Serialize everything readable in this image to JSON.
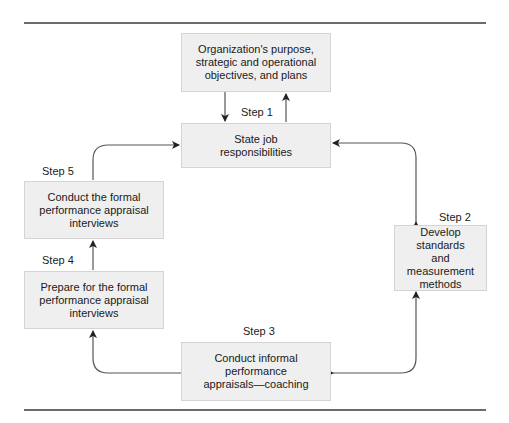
{
  "diagram": {
    "boxes": {
      "purpose": {
        "text": "Organization's purpose,\nstrategic and operational\nobjectives, and plans"
      },
      "step1": {
        "text": "State job\nresponsibilities"
      },
      "step2": {
        "text": "Develop standards\nand measurement\nmethods"
      },
      "step3": {
        "text": "Conduct informal performance\nappraisals—coaching"
      },
      "step4": {
        "text": "Prepare for the formal\nperformance appraisal\ninterviews"
      },
      "step5": {
        "text": "Conduct the formal\nperformance appraisal\ninterviews"
      }
    },
    "step_labels": {
      "step1": "Step 1",
      "step2": "Step 2",
      "step3": "Step 3",
      "step4": "Step 4",
      "step5": "Step 5"
    },
    "colors": {
      "box_fill": "#efefef",
      "box_border": "#d4d4d4",
      "rule": "#6b6b6b",
      "arrow": "#333333"
    }
  }
}
